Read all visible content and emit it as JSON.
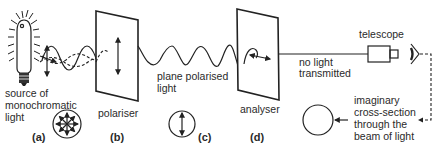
{
  "labels": {
    "source": [
      "source of",
      "monochromatic",
      "light"
    ],
    "polariser": "polariser",
    "plane_polarised": [
      "plane polarised",
      "light"
    ],
    "analyser": "analyser",
    "no_light": [
      "no light",
      "transmitted"
    ],
    "telescope": "telescope",
    "cross_section": [
      "imaginary",
      "cross-section",
      "through the",
      "beam of light"
    ]
  },
  "tags": {
    "a": "(a)",
    "b": "(b)",
    "c": "(c)",
    "d": "(d)"
  },
  "components": [
    {
      "id": "a",
      "name": "light-bulb",
      "role": "source of monochromatic light",
      "cross_section": "unpolarised (arrows in all directions)"
    },
    {
      "id": "b",
      "name": "polariser",
      "transmission_axis": "vertical"
    },
    {
      "id": "c",
      "name": "plane-polarised-light",
      "cross_section": "single vertical double arrow"
    },
    {
      "id": "d",
      "name": "analyser",
      "transmission_axis": "horizontal"
    },
    {
      "id": "telescope",
      "name": "telescope-with-eye"
    }
  ],
  "colors": {
    "ink": "#222222",
    "background": "#ffffff"
  }
}
